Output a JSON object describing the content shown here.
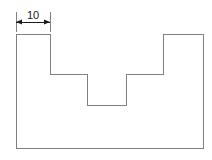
{
  "drawing": {
    "title": "Stepped profile with slot",
    "background_color": "#ffffff",
    "line_color": "#808080",
    "line_width": 1,
    "text_color": "#1a1a1a",
    "viewbox": "0 0 212 160",
    "profile": {
      "name": "stepped-part-outline",
      "points": "16,34 50,34 50,74 87,74 87,105 126,105 126,74 163,74 163,34 203,34 203,148 16,148",
      "closed": true,
      "vertices": [
        {
          "x": 16,
          "y": 34
        },
        {
          "x": 50,
          "y": 34
        },
        {
          "x": 50,
          "y": 74
        },
        {
          "x": 87,
          "y": 74
        },
        {
          "x": 87,
          "y": 105
        },
        {
          "x": 126,
          "y": 105
        },
        {
          "x": 126,
          "y": 74
        },
        {
          "x": 163,
          "y": 74
        },
        {
          "x": 163,
          "y": 34
        },
        {
          "x": 203,
          "y": 34
        },
        {
          "x": 203,
          "y": 148
        },
        {
          "x": 16,
          "y": 148
        }
      ]
    },
    "dimensions": [
      {
        "name": "width-dimension-10",
        "label": "10",
        "orientation": "horizontal",
        "dim_line_y": 22,
        "start_x": 16,
        "end_x": 50,
        "text_x": 33,
        "text_y": 19,
        "extension_lines": [
          {
            "x": 16,
            "y1": 12,
            "y2": 32
          },
          {
            "x": 50,
            "y1": 12,
            "y2": 32
          }
        ],
        "arrow_size": 5,
        "arrow_direction": "outward"
      }
    ]
  }
}
